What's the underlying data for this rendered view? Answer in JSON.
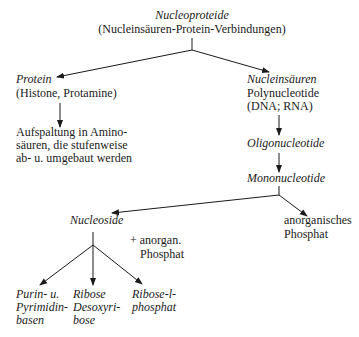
{
  "root": {
    "title": "Nucleoproteide",
    "subtitle": "(Nucleinsäuren-Protein-Verbindungen)"
  },
  "protein_branch": {
    "title": "Protein",
    "subtitle": "(Histone, Protamine)",
    "result_lines": [
      "Aufspaltung in Amino-",
      "säuren, die stufenweise",
      "ab- u. umgebaut werden"
    ]
  },
  "nucleic_branch": {
    "title": "Nucleinsäuren",
    "line2": "Polynucleotide",
    "line3": "(DNA; RNA)",
    "step1": "Oligonucleotide",
    "step2": "Mononucleotide"
  },
  "mononucleotide_products": {
    "nucleoside": "Nucleoside",
    "inorganic_phosphate": [
      "anorganisches",
      "Phosphat"
    ]
  },
  "nucleoside_products": {
    "reagent": [
      "+ anorgan.",
      "Phosphat"
    ],
    "bases": [
      "Purin- u.",
      "Pyrimidin-",
      "basen"
    ],
    "sugars": [
      "Ribose",
      "Desoxyri-",
      "bose"
    ],
    "ribose_phosphate": [
      "Ribose-l-",
      "phosphat"
    ]
  },
  "colors": {
    "ink": "#1a1a1a",
    "background": "#ffffff"
  }
}
